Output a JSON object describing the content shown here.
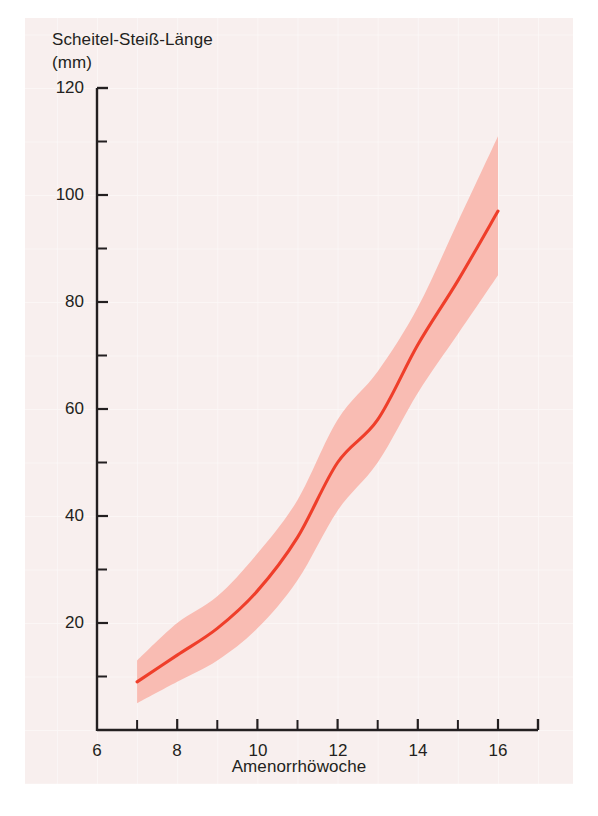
{
  "figure": {
    "background_color": "#ffffff",
    "panel_color": "#f8efee",
    "panel_grid_color": "#ffffff"
  },
  "chart_data": {
    "type": "line",
    "title": "",
    "ylabel_line1": "Scheitel-Steiß-Länge",
    "ylabel_line2": "(mm)",
    "xlabel": "Amenorrhöwoche",
    "xlim": [
      6,
      16.8
    ],
    "ylim": [
      0,
      120
    ],
    "grid": true,
    "legend": null,
    "x_ticks_major": [
      6,
      8,
      10,
      12,
      14,
      16
    ],
    "x_ticks_minor": [
      7,
      9,
      11,
      13,
      15
    ],
    "x_tick_labels": [
      "6",
      "8",
      "10",
      "12",
      "14",
      "16"
    ],
    "y_ticks_major": [
      20,
      40,
      60,
      80,
      100,
      120
    ],
    "y_ticks_minor": [
      10,
      30,
      50,
      70,
      90,
      110
    ],
    "y_tick_labels": [
      "20",
      "40",
      "60",
      "80",
      "100",
      "120"
    ],
    "x": [
      7,
      8,
      9,
      10,
      11,
      12,
      13,
      14,
      15,
      16
    ],
    "series": [
      {
        "name": "Median",
        "role": "center-line",
        "color": "#ef3e2a",
        "values": [
          9,
          14,
          19,
          26,
          36,
          50,
          58,
          72,
          84,
          97
        ]
      },
      {
        "name": "Oberer Streubereich",
        "role": "band-upper",
        "color": "#f9bcb3",
        "values": [
          13,
          20,
          25,
          33,
          43,
          58,
          67,
          79,
          95,
          111
        ]
      },
      {
        "name": "Unterer Streubereich",
        "role": "band-lower",
        "color": "#f9bcb3",
        "values": [
          5,
          9,
          13,
          19,
          28,
          41,
          50,
          63,
          74,
          85
        ]
      }
    ],
    "band_fill_color": "#f9bcb3",
    "line_color": "#ef3e2a",
    "axis_color": "#231f20"
  }
}
